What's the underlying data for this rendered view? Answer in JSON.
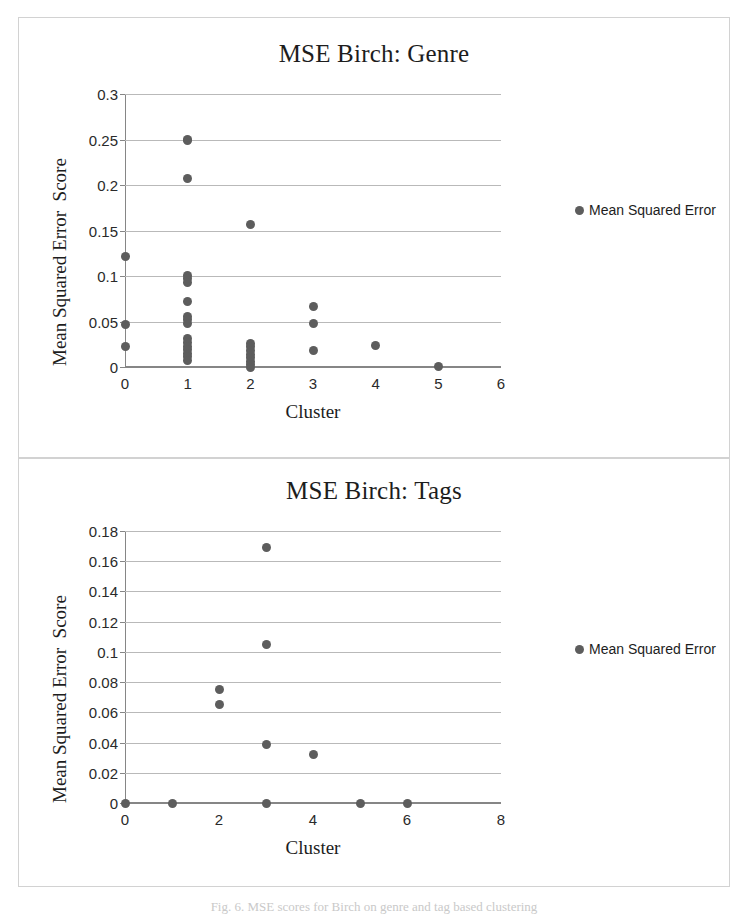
{
  "chart_data": [
    {
      "type": "scatter",
      "title": "MSE Birch: Genre",
      "xlabel": "Cluster",
      "ylabel": "Mean Squared Error  Score",
      "xlim": [
        0,
        6
      ],
      "ylim": [
        0,
        0.3
      ],
      "xticks": [
        "0",
        "1",
        "2",
        "3",
        "4",
        "5",
        "6"
      ],
      "xtick_values": [
        0,
        1,
        2,
        3,
        4,
        5,
        6
      ],
      "yticks": [
        "0",
        "0.05",
        "0.1",
        "0.15",
        "0.2",
        "0.25",
        "0.3"
      ],
      "ytick_values": [
        0,
        0.05,
        0.1,
        0.15,
        0.2,
        0.25,
        0.3
      ],
      "grid": true,
      "legend": [
        "Mean Squared Error"
      ],
      "legend_position": "right",
      "marker_color": "#5d5d5d",
      "series": [
        {
          "name": "Mean Squared Error",
          "points": [
            [
              0,
              0.121
            ],
            [
              0,
              0.047
            ],
            [
              0,
              0.023
            ],
            [
              1,
              0.25
            ],
            [
              1,
              0.249
            ],
            [
              1,
              0.207
            ],
            [
              1,
              0.101
            ],
            [
              1,
              0.097
            ],
            [
              1,
              0.093
            ],
            [
              1,
              0.072
            ],
            [
              1,
              0.056
            ],
            [
              1,
              0.052
            ],
            [
              1,
              0.048
            ],
            [
              1,
              0.031
            ],
            [
              1,
              0.027
            ],
            [
              1,
              0.023
            ],
            [
              1,
              0.019
            ],
            [
              1,
              0.015
            ],
            [
              1,
              0.011
            ],
            [
              1,
              0.007
            ],
            [
              2,
              0.157
            ],
            [
              2,
              0.026
            ],
            [
              2,
              0.022
            ],
            [
              2,
              0.018
            ],
            [
              2,
              0.014
            ],
            [
              2,
              0.01
            ],
            [
              2,
              0.006
            ],
            [
              2,
              0.003
            ],
            [
              2,
              0.0
            ],
            [
              3,
              0.067
            ],
            [
              3,
              0.048
            ],
            [
              3,
              0.018
            ],
            [
              4,
              0.024
            ],
            [
              5,
              0.001
            ]
          ]
        }
      ]
    },
    {
      "type": "scatter",
      "title": "MSE Birch: Tags",
      "xlabel": "Cluster",
      "ylabel": "Mean Squared Error  Score",
      "xlim": [
        0,
        8
      ],
      "ylim": [
        0,
        0.18
      ],
      "xticks": [
        "0",
        "2",
        "4",
        "6",
        "8"
      ],
      "xtick_values": [
        0,
        2,
        4,
        6,
        8
      ],
      "yticks": [
        "0",
        "0.02",
        "0.04",
        "0.06",
        "0.08",
        "0.1",
        "0.12",
        "0.14",
        "0.16",
        "0.18"
      ],
      "ytick_values": [
        0,
        0.02,
        0.04,
        0.06,
        0.08,
        0.1,
        0.12,
        0.14,
        0.16,
        0.18
      ],
      "grid": true,
      "legend": [
        "Mean Squared Error"
      ],
      "legend_position": "right",
      "marker_color": "#5d5d5d",
      "series": [
        {
          "name": "Mean Squared Error",
          "points": [
            [
              0,
              0.0
            ],
            [
              1,
              0.0
            ],
            [
              2,
              0.075
            ],
            [
              2,
              0.065
            ],
            [
              3,
              0.169
            ],
            [
              3,
              0.105
            ],
            [
              3,
              0.039
            ],
            [
              3,
              0.0
            ],
            [
              4,
              0.032
            ],
            [
              5,
              0.0
            ],
            [
              6,
              0.0
            ]
          ]
        }
      ]
    }
  ],
  "caption": {
    "text": "Fig. 6. MSE scores for Birch on genre and tag based clustering"
  }
}
